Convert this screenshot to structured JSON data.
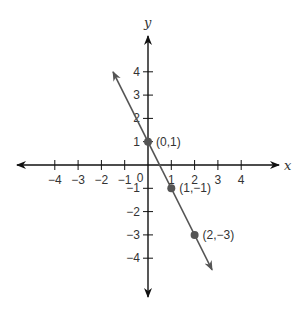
{
  "chart_data": {
    "type": "line",
    "title": "",
    "xlabel": "x",
    "ylabel": "y",
    "xlim": [
      -5,
      5.5
    ],
    "ylim": [
      -5.5,
      5.5
    ],
    "grid": false,
    "x_ticks": [
      -4,
      -3,
      -2,
      -1,
      1,
      2,
      3,
      4
    ],
    "x_tick_labels": [
      "−4",
      "−3",
      "−2",
      "−1",
      "1",
      "2",
      "3",
      "4"
    ],
    "y_ticks": [
      4,
      3,
      2,
      1,
      -1,
      -2,
      -3,
      -4
    ],
    "y_tick_labels": [
      "4",
      "3",
      "2",
      "1",
      "−1",
      "−2",
      "−3",
      "−4"
    ],
    "origin_label": "0",
    "series": [
      {
        "name": "y = -2x + 1",
        "slope": -2,
        "intercept": 1,
        "line_from": [
          -1.5,
          4
        ],
        "line_to": [
          2.75,
          -4.5
        ],
        "color": "#555555"
      }
    ],
    "points": [
      {
        "x": 0,
        "y": 1,
        "label": "(0,1)"
      },
      {
        "x": 1,
        "y": -1,
        "label": "(1,−1)"
      },
      {
        "x": 2,
        "y": -3,
        "label": "(2,−3)"
      }
    ],
    "colors": {
      "axis": "#111111",
      "line": "#555555",
      "point": "#555555"
    }
  }
}
